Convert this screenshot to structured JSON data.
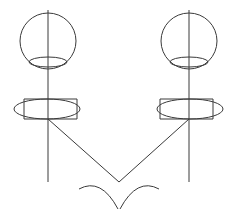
{
  "document": {
    "title": "Technical Line Diagram",
    "canvas": {
      "width": 237,
      "height": 209
    },
    "background_color": "#ffffff",
    "stroke_color": "#3a3a3a",
    "stroke_width": 1
  },
  "diagram": {
    "symmetry_axis_x": 118.5,
    "elements": {
      "left_circle": {
        "name": "left-circle",
        "cx": 48,
        "cy": 41,
        "r": 28
      },
      "right_circle": {
        "name": "right-circle",
        "cx": 189,
        "cy": 41,
        "r": 28
      },
      "left_circle_inner_ellipse": {
        "name": "left-circle-inner-ellipse",
        "cx": 48,
        "cy": 62,
        "rx": 19,
        "ry": 5
      },
      "right_circle_inner_ellipse": {
        "name": "right-circle-inner-ellipse",
        "cx": 189,
        "cy": 62,
        "rx": 19,
        "ry": 5
      },
      "left_axis_line": {
        "name": "left-vertical-axis",
        "x": 48,
        "y1": 10,
        "y2": 182
      },
      "right_axis_line": {
        "name": "right-vertical-axis",
        "x": 189,
        "y1": 10,
        "y2": 182
      },
      "left_lower_rectangle": {
        "name": "left-lower-rectangle",
        "x": 24,
        "y": 99,
        "width": 53,
        "height": 20
      },
      "right_lower_rectangle": {
        "name": "right-lower-rectangle",
        "x": 160,
        "y": 99,
        "width": 53,
        "height": 20
      },
      "left_lower_ellipse": {
        "name": "left-lower-ellipse",
        "cx": 47,
        "cy": 109,
        "rx": 33,
        "ry": 10
      },
      "right_lower_ellipse": {
        "name": "right-lower-ellipse",
        "cx": 190,
        "cy": 109,
        "rx": 33,
        "ry": 10
      },
      "left_diagonal": {
        "name": "left-diagonal-line",
        "x1": 48,
        "y1": 119,
        "x2": 119,
        "y2": 182
      },
      "right_diagonal": {
        "name": "right-diagonal-line",
        "x1": 189,
        "y1": 119,
        "x2": 119,
        "y2": 182
      },
      "left_arc": {
        "name": "left-bottom-arc",
        "start_x": 79,
        "start_y": 189,
        "control_x": 101,
        "control_y": 177,
        "end_x": 118,
        "end_y": 209
      },
      "right_arc": {
        "name": "right-bottom-arc",
        "start_x": 159,
        "start_y": 189,
        "control_x": 137,
        "control_y": 177,
        "end_x": 120,
        "end_y": 209
      }
    }
  }
}
